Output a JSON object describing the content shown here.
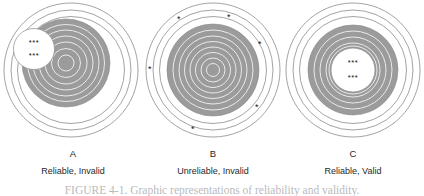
{
  "figure": {
    "title_caption": "FIGURE 4-1.   Graphic representations of reliability and validity.",
    "colors": {
      "target_fill_gray": "#9b9b9b",
      "ring_line_gray": "#8c8c8c",
      "inner_ring_white": "#f2f2f2",
      "background": "#ffffff",
      "text": "#1a1a1a"
    },
    "panels": [
      {
        "letter": "A",
        "caption": "Reliable, Invalid",
        "shot_pattern": "clustered-off-center",
        "marker_groups": [
          {
            "name": "shot-cluster-upper-left",
            "rows": [
              "***",
              "***"
            ]
          }
        ],
        "outer_rings": 3,
        "inner_rings": 6
      },
      {
        "letter": "B",
        "caption": "Unreliable, Invalid",
        "shot_pattern": "scattered-perimeter",
        "markers": [
          {
            "name": "shot-marker-1",
            "glyph": "*"
          },
          {
            "name": "shot-marker-2",
            "glyph": "*"
          },
          {
            "name": "shot-marker-3",
            "glyph": "*"
          },
          {
            "name": "shot-marker-4",
            "glyph": "*"
          },
          {
            "name": "shot-marker-5",
            "glyph": "*"
          },
          {
            "name": "shot-marker-6",
            "glyph": "*"
          }
        ],
        "outer_rings": 3,
        "inner_rings": 7
      },
      {
        "letter": "C",
        "caption": "Reliable, Valid",
        "shot_pattern": "clustered-bullseye",
        "marker_groups": [
          {
            "name": "shot-cluster-center",
            "rows": [
              "***",
              "***"
            ]
          }
        ],
        "outer_rings": 3,
        "inner_rings": 4
      }
    ]
  }
}
